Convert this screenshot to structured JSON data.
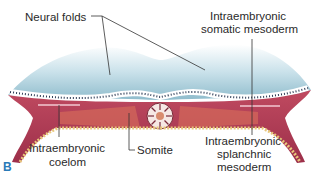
{
  "figure": {
    "panel_letter": "B",
    "labels": {
      "neural_folds": "Neural folds",
      "somatic_1": "Intraembryonic",
      "somatic_2": "somatic mesoderm",
      "coelom_1": "Intraembryonic",
      "coelom_2": "coelom",
      "somite": "Somite",
      "splanchnic_1": "Intraembryonic",
      "splanchnic_2": "splanchnic",
      "splanchnic_3": "mesoderm"
    },
    "colors": {
      "ectoderm": "#b9d7e2",
      "mesoderm": "#b13a55",
      "paraxial": "#d86a5c",
      "endoderm": "#e8c77a",
      "label_text": "#2a2a2a",
      "panel_letter": "#2a7ab8"
    }
  }
}
